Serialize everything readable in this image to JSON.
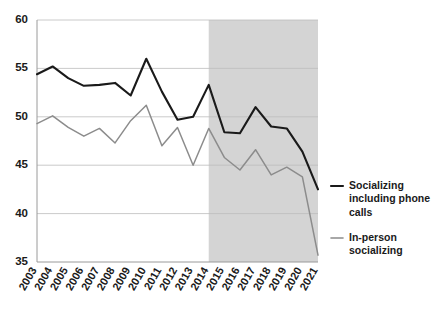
{
  "chart_data": {
    "type": "line",
    "title": "",
    "subtitle": "",
    "xlabel": "",
    "ylabel": "",
    "xlim": [
      2003,
      2021
    ],
    "ylim": [
      35,
      60
    ],
    "yticks": [
      35,
      40,
      45,
      50,
      55,
      60
    ],
    "grid": true,
    "legend_position": "right",
    "categories": [
      "2003",
      "2004",
      "2005",
      "2006",
      "2007",
      "2008",
      "2009",
      "2010",
      "2011",
      "2012",
      "2013",
      "2014",
      "2015",
      "2016",
      "2017",
      "2018",
      "2019",
      "2020",
      "2021"
    ],
    "series": [
      {
        "name": "Socializing including phone calls",
        "color": "#1a1a1a",
        "values": [
          54.4,
          55.2,
          54.0,
          53.2,
          53.3,
          53.5,
          52.2,
          56.0,
          52.6,
          49.7,
          50.0,
          53.3,
          48.4,
          48.3,
          51.0,
          49.0,
          48.8,
          46.4,
          42.5
        ]
      },
      {
        "name": "In-person socializing",
        "color": "#8c8c8c",
        "values": [
          49.3,
          50.1,
          48.9,
          48.0,
          48.8,
          47.3,
          49.6,
          51.2,
          47.0,
          48.9,
          45.0,
          48.8,
          45.8,
          44.5,
          46.6,
          44.0,
          44.8,
          43.8,
          35.7
        ]
      }
    ],
    "shaded_region": {
      "label": "",
      "from": "2014",
      "to": "2021",
      "color": "#d4d4d4"
    },
    "legend": [
      {
        "label_line1": "Socializing",
        "label_line2": "including phone",
        "label_line3": "calls",
        "color": "#1a1a1a"
      },
      {
        "label_line1": "In-person",
        "label_line2": "socializing",
        "label_line3": "",
        "color": "#8c8c8c"
      }
    ]
  }
}
